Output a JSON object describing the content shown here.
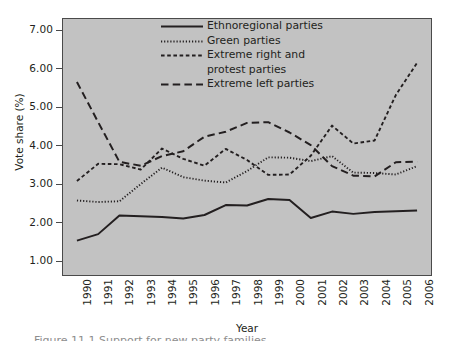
{
  "figure": {
    "caption_fragment": "Figure 11.1   Support for new party families"
  },
  "chart_data": {
    "type": "line",
    "title": "",
    "xlabel": "Year",
    "ylabel": "Vote share (%)",
    "xlim": [
      1990,
      2006
    ],
    "ylim": [
      0.6,
      7.3
    ],
    "yticks": [
      "1.00",
      "2.00",
      "3.00",
      "4.00",
      "5.00",
      "6.00",
      "7.00"
    ],
    "ytick_values": [
      1,
      2,
      3,
      4,
      5,
      6,
      7
    ],
    "grid": false,
    "legend_position": "top-center",
    "background_color": "#c2c2c2",
    "line_color": "#231f20",
    "categories": [
      1990,
      1991,
      1992,
      1993,
      1994,
      1995,
      1996,
      1997,
      1998,
      1999,
      2000,
      2001,
      2002,
      2003,
      2004,
      2005,
      2006
    ],
    "xtick_labels": [
      "1990",
      "1991",
      "1992",
      "1993",
      "1994",
      "1995",
      "1996",
      "1997",
      "1998",
      "1999",
      "2000",
      "2001",
      "2002",
      "2003",
      "2004",
      "2005",
      "2006"
    ],
    "series": [
      {
        "name": "Ethnoregional parties",
        "style": "solid",
        "values": [
          1.5,
          1.67,
          2.16,
          2.14,
          2.12,
          2.08,
          2.17,
          2.43,
          2.42,
          2.59,
          2.56,
          2.09,
          2.26,
          2.2,
          2.25,
          2.27,
          2.29
        ]
      },
      {
        "name": "Green parties",
        "style": "dotted",
        "values": [
          2.55,
          2.51,
          2.53,
          2.98,
          3.41,
          3.16,
          3.07,
          3.02,
          3.32,
          3.68,
          3.67,
          3.58,
          3.71,
          3.28,
          3.27,
          3.23,
          3.45
        ]
      },
      {
        "name": "Extreme right and protest parties",
        "style": "dashed",
        "values": [
          3.06,
          3.51,
          3.5,
          3.36,
          3.91,
          3.64,
          3.46,
          3.9,
          3.61,
          3.22,
          3.23,
          3.72,
          4.51,
          4.04,
          4.12,
          5.31,
          6.15
        ]
      },
      {
        "name": "Extreme left parties",
        "style": "longdash",
        "values": [
          5.65,
          4.6,
          3.56,
          3.46,
          3.71,
          3.84,
          4.22,
          4.35,
          4.58,
          4.6,
          4.33,
          4.0,
          3.45,
          3.2,
          3.18,
          3.55,
          3.57
        ]
      }
    ]
  },
  "legend": {
    "items": [
      {
        "label": "Ethnoregional parties",
        "label2": "",
        "style": "solid"
      },
      {
        "label": "Green parties",
        "label2": "",
        "style": "dotted"
      },
      {
        "label": "Extreme right and",
        "label2": "protest parties",
        "style": "dashed"
      },
      {
        "label": "Extreme left parties",
        "label2": "",
        "style": "longdash"
      }
    ]
  }
}
